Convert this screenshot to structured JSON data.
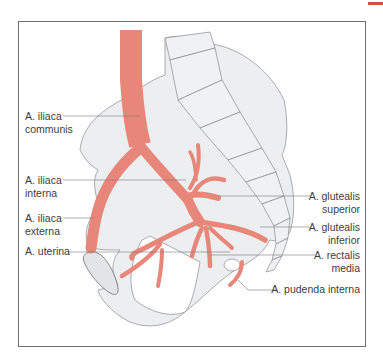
{
  "figure": {
    "accent_color": "#d9503a",
    "artery_color": "#e8867a",
    "bone_fill": "#eceef0",
    "bone_stroke": "#8a8a8a",
    "leader_color": "#7a7a7a"
  },
  "labels": {
    "iliaca_communis": {
      "line1": "A. iliaca",
      "line2": "communis"
    },
    "iliaca_interna": {
      "line1": "A. iliaca",
      "line2": "interna"
    },
    "iliaca_externa": {
      "line1": "A. iliaca",
      "line2": "externa"
    },
    "uterina": {
      "line1": "A. uterina"
    },
    "glutealis_superior": {
      "line1": "A. glutealis",
      "line2": "superior"
    },
    "glutealis_inferior": {
      "line1": "A. glutealis",
      "line2": "inferior"
    },
    "rectalis_media": {
      "line1": "A. rectalis",
      "line2": "media"
    },
    "pudenda_interna": {
      "line1": "A. pudenda interna"
    }
  }
}
